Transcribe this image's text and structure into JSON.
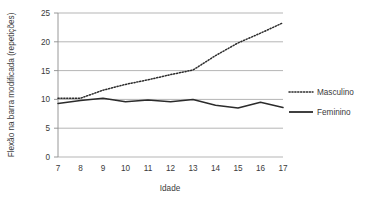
{
  "chart_data": {
    "type": "line",
    "title": "",
    "xlabel": "Idade",
    "ylabel": "Flexão na barra modificada (repetições)",
    "x": [
      7,
      8,
      9,
      10,
      11,
      12,
      13,
      14,
      15,
      16,
      17
    ],
    "xtick_labels": [
      "7",
      "8",
      "9",
      "10",
      "11",
      "12",
      "13",
      "14",
      "15",
      "16",
      "17"
    ],
    "ytick_labels": [
      "0",
      "5",
      "10",
      "15",
      "20",
      "25"
    ],
    "yticks": [
      0,
      5,
      10,
      15,
      20,
      25
    ],
    "ylim": [
      0,
      25
    ],
    "xlim": [
      7,
      17
    ],
    "grid": "horizontal",
    "legend_position": "right",
    "series": [
      {
        "name": "Masculino",
        "style": "dotted",
        "color": "#2b2b2b",
        "values": [
          10.2,
          10.2,
          11.6,
          12.6,
          13.4,
          14.3,
          15.1,
          17.6,
          19.8,
          21.5,
          23.3
        ]
      },
      {
        "name": "Feminino",
        "style": "solid",
        "color": "#2b2b2b",
        "values": [
          9.3,
          9.8,
          10.2,
          9.6,
          9.9,
          9.6,
          10.0,
          9.0,
          8.5,
          9.5,
          8.6
        ]
      }
    ],
    "gridline_color": "#b5b5b5",
    "axis_color": "#8d8d8d",
    "background": "#ffffff"
  }
}
